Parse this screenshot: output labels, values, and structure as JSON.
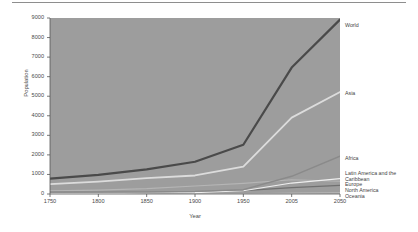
{
  "chart_data": {
    "type": "line",
    "title": "",
    "subtitle": "",
    "xlabel": "Year",
    "ylabel": "Population",
    "xticks": [
      "1750",
      "1800",
      "1850",
      "1900",
      "1950",
      "2005",
      "2050"
    ],
    "xtick_values": [
      1750,
      1800,
      1850,
      1900,
      1950,
      2005,
      2050
    ],
    "yticks": [
      "0",
      "1000",
      "2000",
      "3000",
      "4000",
      "5000",
      "6000",
      "7000",
      "8000",
      "9000"
    ],
    "ytick_values": [
      0,
      1000,
      2000,
      3000,
      4000,
      5000,
      6000,
      7000,
      8000,
      9000
    ],
    "ylim": [
      0,
      9000
    ],
    "xlim": [
      1750,
      2050
    ],
    "grid": false,
    "legend_position": "right-inline",
    "plot_background": "#9d9d9d",
    "x": [
      1750,
      1800,
      1850,
      1900,
      1950,
      2005,
      2050
    ],
    "series": [
      {
        "name": "World",
        "color": "#4a4a4a",
        "width": 2.2,
        "values": [
          791,
          978,
          1262,
          1650,
          2519,
          6465,
          8919
        ],
        "label_y": 22
      },
      {
        "name": "Asia",
        "color": "#dcdcdc",
        "width": 1.8,
        "values": [
          502,
          635,
          809,
          947,
          1398,
          3905,
          5217
        ],
        "label_y": 90
      },
      {
        "name": "Africa",
        "color": "#8a8a8a",
        "width": 1.4,
        "values": [
          106,
          107,
          111,
          133,
          221,
          906,
          1937
        ],
        "label_y": 155
      },
      {
        "name": "Latin America and the Caribbean",
        "color": "#efefef",
        "width": 1.2,
        "values": [
          16,
          24,
          38,
          74,
          167,
          561,
          783
        ],
        "label_y": 170
      },
      {
        "name": "Europe",
        "color": "#b5b5b5",
        "width": 1.2,
        "values": [
          163,
          203,
          276,
          408,
          547,
          728,
          653
        ],
        "label_y": 181
      },
      {
        "name": "North America",
        "color": "#707070",
        "width": 1.2,
        "values": [
          2,
          7,
          26,
          82,
          172,
          331,
          438
        ],
        "label_y": 187
      },
      {
        "name": "Oceania",
        "color": "#c9c9c9",
        "width": 1.1,
        "values": [
          2,
          2,
          2,
          6,
          13,
          33,
          48
        ],
        "label_y": 193
      }
    ]
  }
}
